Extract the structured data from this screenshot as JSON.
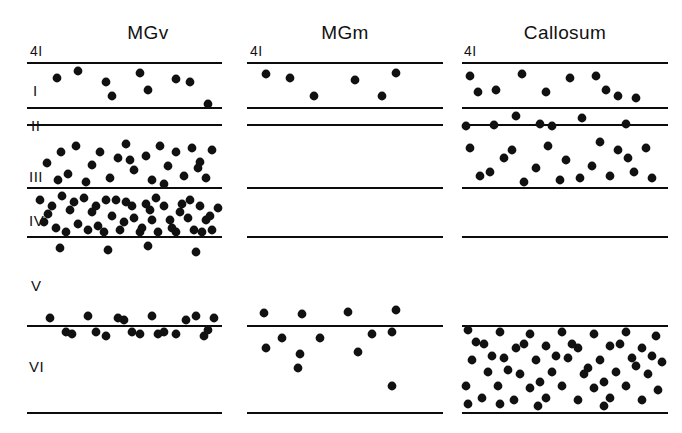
{
  "figure": {
    "title_visible": false,
    "background_color": "#ffffff",
    "ink_color": "#111111",
    "width": 682,
    "height": 433
  },
  "columns": [
    {
      "id": "mgv",
      "label": "MGv",
      "title_x": 148,
      "title_y": 22,
      "x0": 27,
      "x1": 222
    },
    {
      "id": "mgm",
      "label": "MGm",
      "title_x": 345,
      "title_y": 22,
      "x0": 247,
      "x1": 443
    },
    {
      "id": "callosum",
      "label": "Callosum",
      "title_x": 565,
      "title_y": 22,
      "x0": 462,
      "x1": 668
    }
  ],
  "top_labels": [
    {
      "text": "4I",
      "x": 30,
      "y": 43
    },
    {
      "text": "4I",
      "x": 250,
      "y": 43
    },
    {
      "text": "4I",
      "x": 464,
      "y": 43
    }
  ],
  "layer_labels": [
    {
      "text": "I",
      "x": 33,
      "y": 82
    },
    {
      "text": "II",
      "x": 31,
      "y": 117
    },
    {
      "text": "III",
      "x": 29,
      "y": 168
    },
    {
      "text": "IV",
      "x": 29,
      "y": 212
    },
    {
      "text": "V",
      "x": 31,
      "y": 277
    },
    {
      "text": "VI",
      "x": 29,
      "y": 358
    }
  ],
  "boundary_lines": {
    "description": "Horizontal laminar boundary lines drawn across each column",
    "y_positions": [
      63,
      108,
      125,
      188,
      237,
      326,
      413
    ],
    "stroke_width": 2.2,
    "per_column": {
      "mgv": [
        63,
        108,
        125,
        188,
        237,
        326,
        413
      ],
      "mgm": [
        63,
        108,
        125,
        188,
        237,
        326,
        413
      ],
      "callosum": [
        63,
        108,
        125,
        188,
        237,
        326,
        413
      ]
    }
  },
  "chart_data": {
    "type": "scatter",
    "xlabel": "",
    "ylabel": "Cortical layer",
    "grid": false,
    "legend": "none",
    "dot_radius": 4.4,
    "layers": [
      "4I",
      "I",
      "II",
      "III",
      "IV",
      "V",
      "VI"
    ],
    "series": [
      {
        "name": "MGv",
        "counts_by_layer": {
          "I": 9,
          "II": 0,
          "III": 24,
          "IV": 62,
          "V": 4,
          "VI": 19
        },
        "points": [
          [
            57,
            78
          ],
          [
            78,
            71
          ],
          [
            106,
            82
          ],
          [
            112,
            96
          ],
          [
            140,
            73
          ],
          [
            148,
            90
          ],
          [
            176,
            79
          ],
          [
            190,
            82
          ],
          [
            208,
            104
          ],
          [
            47,
            163
          ],
          [
            61,
            152
          ],
          [
            68,
            174
          ],
          [
            76,
            146
          ],
          [
            92,
            165
          ],
          [
            100,
            152
          ],
          [
            110,
            178
          ],
          [
            118,
            158
          ],
          [
            126,
            144
          ],
          [
            134,
            170
          ],
          [
            146,
            156
          ],
          [
            152,
            180
          ],
          [
            160,
            146
          ],
          [
            168,
            166
          ],
          [
            176,
            152
          ],
          [
            184,
            176
          ],
          [
            192,
            148
          ],
          [
            200,
            162
          ],
          [
            206,
            178
          ],
          [
            212,
            150
          ],
          [
            58,
            180
          ],
          [
            86,
            182
          ],
          [
            130,
            160
          ],
          [
            164,
            184
          ],
          [
            198,
            168
          ],
          [
            40,
            200
          ],
          [
            48,
            214
          ],
          [
            56,
            228
          ],
          [
            62,
            196
          ],
          [
            70,
            210
          ],
          [
            78,
            224
          ],
          [
            84,
            198
          ],
          [
            92,
            212
          ],
          [
            98,
            226
          ],
          [
            106,
            200
          ],
          [
            112,
            216
          ],
          [
            120,
            230
          ],
          [
            126,
            202
          ],
          [
            134,
            218
          ],
          [
            140,
            232
          ],
          [
            146,
            204
          ],
          [
            152,
            220
          ],
          [
            158,
            232
          ],
          [
            164,
            206
          ],
          [
            170,
            220
          ],
          [
            176,
            232
          ],
          [
            182,
            204
          ],
          [
            188,
            218
          ],
          [
            194,
            230
          ],
          [
            200,
            206
          ],
          [
            206,
            220
          ],
          [
            212,
            230
          ],
          [
            218,
            208
          ],
          [
            44,
            222
          ],
          [
            52,
            206
          ],
          [
            66,
            232
          ],
          [
            74,
            202
          ],
          [
            88,
            230
          ],
          [
            96,
            206
          ],
          [
            104,
            232
          ],
          [
            116,
            200
          ],
          [
            124,
            222
          ],
          [
            132,
            206
          ],
          [
            142,
            228
          ],
          [
            150,
            210
          ],
          [
            156,
            198
          ],
          [
            172,
            228
          ],
          [
            180,
            212
          ],
          [
            190,
            200
          ],
          [
            202,
            232
          ],
          [
            210,
            216
          ],
          [
            60,
            248
          ],
          [
            108,
            250
          ],
          [
            148,
            246
          ],
          [
            196,
            252
          ],
          [
            50,
            318
          ],
          [
            66,
            332
          ],
          [
            88,
            316
          ],
          [
            106,
            336
          ],
          [
            124,
            320
          ],
          [
            140,
            334
          ],
          [
            152,
            316
          ],
          [
            164,
            332
          ],
          [
            176,
            334
          ],
          [
            186,
            320
          ],
          [
            196,
            316
          ],
          [
            204,
            336
          ],
          [
            214,
            318
          ],
          [
            72,
            334
          ],
          [
            96,
            332
          ],
          [
            118,
            318
          ],
          [
            132,
            332
          ],
          [
            158,
            334
          ],
          [
            208,
            330
          ]
        ]
      },
      {
        "name": "MGm",
        "counts_by_layer": {
          "I": 6,
          "II": 0,
          "III": 0,
          "IV": 0,
          "V": 0,
          "VI": 11
        },
        "points": [
          [
            266,
            74
          ],
          [
            290,
            78
          ],
          [
            314,
            96
          ],
          [
            355,
            80
          ],
          [
            382,
            96
          ],
          [
            396,
            73
          ],
          [
            264,
            313
          ],
          [
            302,
            314
          ],
          [
            348,
            312
          ],
          [
            396,
            310
          ],
          [
            282,
            338
          ],
          [
            320,
            338
          ],
          [
            372,
            334
          ],
          [
            392,
            332
          ],
          [
            300,
            354
          ],
          [
            358,
            352
          ],
          [
            266,
            348
          ],
          [
            298,
            368
          ],
          [
            392,
            386
          ]
        ]
      },
      {
        "name": "Callosum",
        "counts_by_layer": {
          "I": 10,
          "II": 7,
          "III": 18,
          "IV": 0,
          "V": 0,
          "VI": 58
        },
        "points": [
          [
            470,
            76
          ],
          [
            496,
            90
          ],
          [
            522,
            74
          ],
          [
            546,
            92
          ],
          [
            570,
            78
          ],
          [
            596,
            76
          ],
          [
            618,
            96
          ],
          [
            636,
            98
          ],
          [
            478,
            92
          ],
          [
            606,
            90
          ],
          [
            466,
            126
          ],
          [
            494,
            125
          ],
          [
            516,
            116
          ],
          [
            552,
            126
          ],
          [
            582,
            118
          ],
          [
            626,
            124
          ],
          [
            540,
            124
          ],
          [
            470,
            148
          ],
          [
            490,
            172
          ],
          [
            512,
            150
          ],
          [
            524,
            182
          ],
          [
            548,
            146
          ],
          [
            566,
            160
          ],
          [
            580,
            178
          ],
          [
            600,
            142
          ],
          [
            618,
            150
          ],
          [
            634,
            172
          ],
          [
            646,
            148
          ],
          [
            480,
            176
          ],
          [
            504,
            158
          ],
          [
            536,
            168
          ],
          [
            560,
            180
          ],
          [
            592,
            166
          ],
          [
            610,
            176
          ],
          [
            628,
            158
          ],
          [
            652,
            178
          ],
          [
            468,
            330
          ],
          [
            484,
            344
          ],
          [
            500,
            332
          ],
          [
            516,
            348
          ],
          [
            530,
            334
          ],
          [
            546,
            346
          ],
          [
            562,
            332
          ],
          [
            578,
            348
          ],
          [
            594,
            334
          ],
          [
            610,
            346
          ],
          [
            626,
            332
          ],
          [
            642,
            348
          ],
          [
            656,
            336
          ],
          [
            472,
            360
          ],
          [
            488,
            372
          ],
          [
            504,
            358
          ],
          [
            520,
            374
          ],
          [
            536,
            360
          ],
          [
            552,
            372
          ],
          [
            568,
            358
          ],
          [
            584,
            374
          ],
          [
            600,
            360
          ],
          [
            616,
            372
          ],
          [
            632,
            358
          ],
          [
            648,
            374
          ],
          [
            662,
            362
          ],
          [
            466,
            386
          ],
          [
            482,
            398
          ],
          [
            498,
            386
          ],
          [
            514,
            400
          ],
          [
            530,
            388
          ],
          [
            546,
            398
          ],
          [
            562,
            386
          ],
          [
            578,
            400
          ],
          [
            594,
            388
          ],
          [
            610,
            398
          ],
          [
            626,
            386
          ],
          [
            642,
            400
          ],
          [
            658,
            390
          ],
          [
            476,
            342
          ],
          [
            492,
            356
          ],
          [
            508,
            370
          ],
          [
            524,
            344
          ],
          [
            540,
            382
          ],
          [
            556,
            356
          ],
          [
            572,
            344
          ],
          [
            588,
            368
          ],
          [
            604,
            382
          ],
          [
            620,
            344
          ],
          [
            636,
            366
          ],
          [
            652,
            356
          ],
          [
            468,
            404
          ],
          [
            604,
            406
          ],
          [
            538,
            406
          ],
          [
            500,
            404
          ]
        ]
      }
    ]
  }
}
